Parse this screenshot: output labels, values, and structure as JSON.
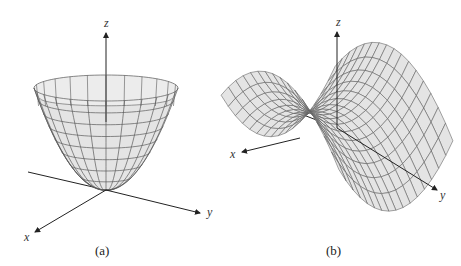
{
  "figures": [
    {
      "id": "a",
      "caption": "(a)",
      "surface": "elliptic paraboloid",
      "axes": {
        "x": "x",
        "y": "y",
        "z": "z"
      }
    },
    {
      "id": "b",
      "caption": "(b)",
      "surface": "hyperbolic paraboloid (saddle)",
      "axes": {
        "x": "x",
        "y": "y",
        "z": "z"
      }
    }
  ],
  "colors": {
    "surface": "#e4e4e4",
    "grid": "#5a5a5a",
    "axis": "#222222",
    "background": "#ffffff"
  }
}
